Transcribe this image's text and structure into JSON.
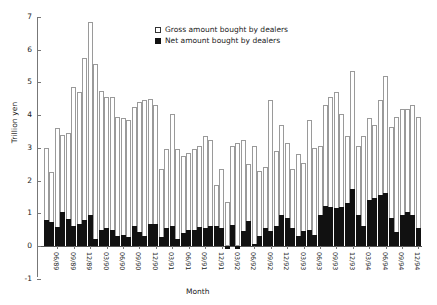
{
  "chart_data": {
    "type": "bar",
    "title": "",
    "xlabel": "Month",
    "ylabel": "Trillion yen",
    "ylim": [
      -1,
      7
    ],
    "yticks": [
      -1,
      0,
      1,
      2,
      3,
      4,
      5,
      6,
      7
    ],
    "ytick_labels": [
      "-1",
      "0",
      "1",
      "2",
      "3",
      "4",
      "5",
      "6",
      "7"
    ],
    "grid": false,
    "legend_position": "top-center",
    "legend": [
      "Gross amount bought by dealers",
      "Net amount bought by dealers"
    ],
    "colors": {
      "gross": "#ffffff",
      "gross_edge": "#9a9a9a",
      "net": "#111111",
      "axis": "#777777"
    },
    "categories": [
      "04/89",
      "05/89",
      "06/89",
      "07/89",
      "08/89",
      "09/89",
      "10/89",
      "11/89",
      "12/89",
      "01/90",
      "02/90",
      "03/90",
      "04/90",
      "05/90",
      "06/90",
      "07/90",
      "08/90",
      "09/90",
      "10/90",
      "11/90",
      "12/90",
      "01/91",
      "02/91",
      "03/91",
      "04/91",
      "05/91",
      "06/91",
      "07/91",
      "08/91",
      "09/91",
      "10/91",
      "11/91",
      "12/91",
      "01/92",
      "02/92",
      "03/92",
      "04/92",
      "05/92",
      "06/92",
      "07/92",
      "08/92",
      "09/92",
      "10/92",
      "11/92",
      "12/92",
      "01/93",
      "02/93",
      "03/93",
      "04/93",
      "05/93",
      "06/93",
      "07/93",
      "08/93",
      "09/93",
      "10/93",
      "11/93",
      "12/93",
      "01/94",
      "02/94",
      "03/94",
      "04/94",
      "05/94",
      "06/94",
      "07/94",
      "08/94",
      "09/94",
      "10/94",
      "11/94",
      "12/94"
    ],
    "xtick_labels": [
      "06/89",
      "09/89",
      "12/89",
      "03/90",
      "06/90",
      "09/90",
      "12/90",
      "03/91",
      "06/91",
      "09/91",
      "12/91",
      "03/92",
      "06/92",
      "09/92",
      "12/92",
      "03/93",
      "06/93",
      "09/93",
      "12/93",
      "03/94",
      "06/94",
      "09/94",
      "12/94"
    ],
    "xtick_indices": [
      2,
      5,
      8,
      11,
      14,
      17,
      20,
      23,
      26,
      29,
      32,
      35,
      38,
      41,
      44,
      47,
      50,
      53,
      56,
      59,
      62,
      65,
      68
    ],
    "series": [
      {
        "name": "Gross amount bought by dealers",
        "values": [
          3.0,
          2.25,
          3.6,
          3.4,
          3.45,
          4.85,
          4.7,
          5.75,
          6.85,
          5.55,
          4.75,
          4.55,
          4.55,
          3.95,
          3.9,
          3.85,
          4.25,
          4.4,
          4.45,
          4.5,
          4.3,
          2.35,
          2.95,
          4.05,
          2.95,
          2.75,
          2.85,
          2.95,
          3.05,
          3.35,
          3.25,
          1.85,
          2.35,
          1.35,
          3.05,
          3.15,
          3.25,
          2.5,
          3.05,
          2.3,
          2.4,
          4.45,
          2.9,
          3.7,
          3.15,
          2.35,
          2.8,
          2.55,
          3.85,
          3.0,
          3.05,
          4.3,
          4.55,
          4.7,
          4.05,
          3.35,
          5.35,
          3.05,
          3.35,
          3.9,
          3.7,
          4.45,
          5.2,
          3.65,
          3.95,
          4.2,
          4.2,
          4.3,
          3.95
        ]
      },
      {
        "name": "Net amount bought by dealers",
        "values": [
          0.78,
          0.72,
          0.58,
          1.03,
          0.82,
          0.62,
          0.68,
          0.78,
          0.95,
          0.22,
          0.5,
          0.55,
          0.48,
          0.32,
          0.35,
          0.28,
          0.6,
          0.42,
          0.32,
          0.68,
          0.66,
          0.28,
          0.55,
          0.62,
          0.2,
          0.4,
          0.5,
          0.48,
          0.58,
          0.55,
          0.62,
          0.62,
          0.55,
          -0.1,
          0.65,
          -0.08,
          0.45,
          0.75,
          0.06,
          0.32,
          0.55,
          0.45,
          0.6,
          0.95,
          0.85,
          0.55,
          0.3,
          0.45,
          0.5,
          0.35,
          0.95,
          1.22,
          1.18,
          1.15,
          1.18,
          1.3,
          1.75,
          0.95,
          0.6,
          1.42,
          1.48,
          1.55,
          1.62,
          0.85,
          0.42,
          0.95,
          1.05,
          0.95,
          0.55
        ]
      }
    ]
  }
}
